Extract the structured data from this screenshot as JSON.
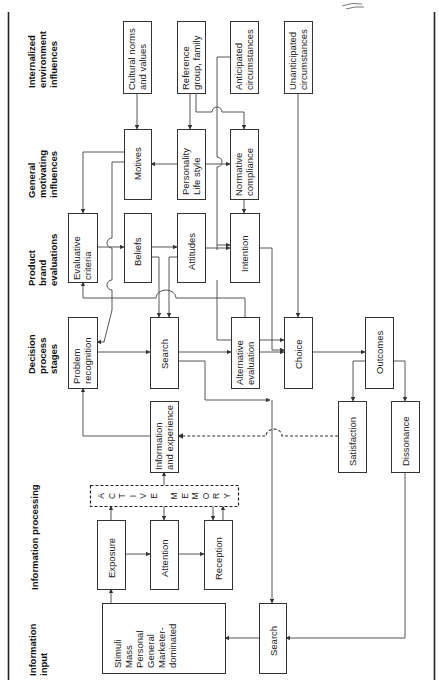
{
  "diagram": {
    "column_headers": {
      "internalized": [
        "Internalized",
        "environment",
        "influences"
      ],
      "motivating": [
        "General",
        "motivating",
        "influences"
      ],
      "evaluations": [
        "Product",
        "brand",
        "evaluations"
      ],
      "decision": [
        "Decision",
        "process",
        "stages"
      ],
      "processing": [
        "Information processing"
      ],
      "input": [
        "Information",
        "input"
      ]
    },
    "boxes": {
      "cultural_norms": [
        "Cultural norms",
        "and values"
      ],
      "reference_group": [
        "Reference",
        "group, family"
      ],
      "anticipated": [
        "Anticipated",
        "circumstances"
      ],
      "unanticipated": [
        "Unanticipated",
        "circumstances"
      ],
      "motives": [
        "Motives"
      ],
      "personality": [
        "Personality",
        "Life style"
      ],
      "normative": [
        "Normative",
        "compliance"
      ],
      "evaluative_criteria": [
        "Evaluative",
        "criteria"
      ],
      "beliefs": [
        "Beliefs"
      ],
      "attitudes": [
        "Attitudes"
      ],
      "intention": [
        "Intention"
      ],
      "problem_recognition": [
        "Problem",
        "recognition"
      ],
      "search": [
        "Search"
      ],
      "alternative_evaluation": [
        "Alternative",
        "evaluation"
      ],
      "choice": [
        "Choice"
      ],
      "outcomes": [
        "Outcomes"
      ],
      "info_experience": [
        "Information",
        "and experience"
      ],
      "satisfaction": [
        "Satisfaction"
      ],
      "dissonance": [
        "Dissonance"
      ],
      "active_memory": [
        "A C T I V E",
        "M E M O R Y"
      ],
      "exposure": [
        "Exposure"
      ],
      "attention": [
        "Attention"
      ],
      "reception": [
        "Reception"
      ],
      "stimuli": [
        "Stimuli",
        "Mass",
        "Personal",
        "General",
        "Marketer-",
        "dominated"
      ],
      "search_external": [
        "Search"
      ]
    }
  }
}
